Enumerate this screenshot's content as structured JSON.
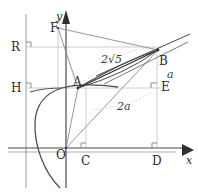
{
  "figure": {
    "colors": {
      "axis": "#3f3f3f",
      "curve": "#4a4a4a",
      "construction": "#8c8c8c",
      "light_guide": "#b9b9b9",
      "dotted_arc": "#bdbdbd",
      "label": "#2b2b2b"
    },
    "points": [
      {
        "name": "y-axis-label",
        "label": "y",
        "x": 56,
        "y": 11,
        "style": "axis"
      },
      {
        "name": "x-axis-label",
        "label": "x",
        "x": 186,
        "y": 155,
        "style": "axis"
      },
      {
        "name": "point-F",
        "label": "F",
        "x": 50,
        "y": 22,
        "style": "point"
      },
      {
        "name": "point-R",
        "label": "R",
        "x": 11,
        "y": 41,
        "style": "point"
      },
      {
        "name": "point-H",
        "label": "H",
        "x": 11,
        "y": 82,
        "style": "point"
      },
      {
        "name": "point-A",
        "label": "A",
        "x": 73,
        "y": 76,
        "style": "point"
      },
      {
        "name": "point-B",
        "label": "B",
        "x": 159,
        "y": 55,
        "style": "point"
      },
      {
        "name": "point-E",
        "label": "E",
        "x": 161,
        "y": 81,
        "style": "point"
      },
      {
        "name": "point-O",
        "label": "O",
        "x": 56,
        "y": 149,
        "style": "point"
      },
      {
        "name": "point-C",
        "label": "C",
        "x": 81,
        "y": 155,
        "style": "point"
      },
      {
        "name": "point-D",
        "label": "D",
        "x": 152,
        "y": 155,
        "style": "point"
      }
    ],
    "measures": [
      {
        "name": "measure-two-sqrt-five",
        "text": "2√5",
        "x": 101,
        "y": 54
      },
      {
        "name": "measure-a",
        "text": "a",
        "x": 167,
        "y": 69
      },
      {
        "name": "measure-two-a",
        "text": "2a",
        "x": 117,
        "y": 101
      }
    ],
    "geometry": {
      "origin": {
        "x": 66,
        "y": 148
      },
      "directrix_x": 26,
      "focus": {
        "x": 58,
        "y": 28
      },
      "vertex_hint": {
        "x": 37,
        "y": 118
      },
      "A": {
        "x": 78,
        "y": 88
      },
      "B": {
        "x": 158,
        "y": 50
      },
      "C": {
        "x": 86,
        "y": 148
      },
      "D": {
        "x": 157,
        "y": 148
      },
      "E": {
        "x": 157,
        "y": 88
      },
      "R": {
        "x": 26,
        "y": 47
      },
      "H": {
        "x": 26,
        "y": 88
      }
    }
  }
}
